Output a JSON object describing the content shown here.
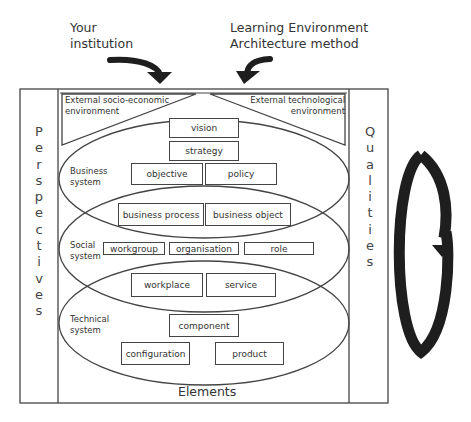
{
  "header": {
    "left_label_line1": "Your",
    "left_label_line2": "institution",
    "right_label_line1": "Learning Environment",
    "right_label_line2": "Architecture method"
  },
  "environments": {
    "left_line1": "External socio-economic",
    "left_line2": "environment",
    "right_line1": "External technological",
    "right_line2": "environment"
  },
  "side_columns": {
    "left": [
      "P",
      "e",
      "r",
      "s",
      "p",
      "e",
      "c",
      "t",
      "i",
      "v",
      "e",
      "s"
    ],
    "right": [
      "Q",
      "u",
      "a",
      "l",
      "i",
      "t",
      "i",
      "e",
      "s"
    ]
  },
  "systems": {
    "business": {
      "line1": "Business",
      "line2": "system"
    },
    "social": {
      "line1": "Social",
      "line2": "system"
    },
    "technical": {
      "line1": "Technical",
      "line2": "system"
    }
  },
  "boxes": {
    "vision": "vision",
    "strategy": "strategy",
    "objective": "objective",
    "policy": "policy",
    "business_process": "business process",
    "business_object": "business object",
    "workgroup": "workgroup",
    "organisation": "organisation",
    "role": "role",
    "workplace": "workplace",
    "service": "service",
    "component": "component",
    "configuration": "configuration",
    "product": "product"
  },
  "footer": {
    "label": "Elements"
  },
  "colors": {
    "line": "#444444",
    "arrow": "#1e1e1e",
    "background": "#ffffff"
  }
}
